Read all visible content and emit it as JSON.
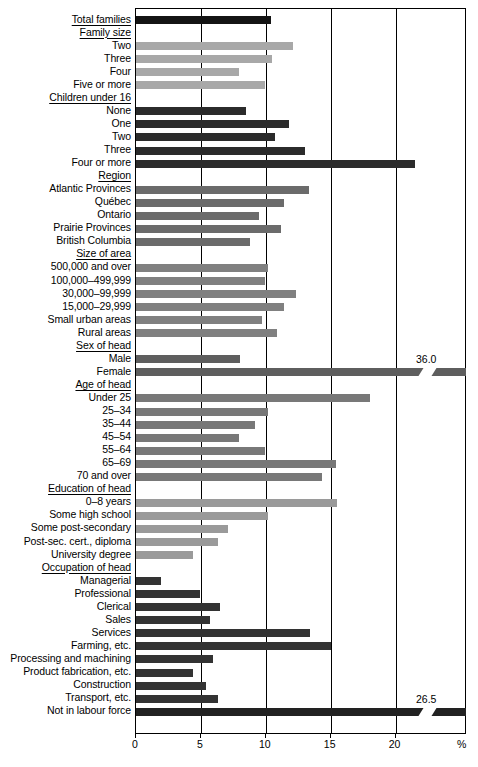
{
  "chart_data": {
    "type": "bar",
    "orientation": "horizontal",
    "title": "",
    "xlabel": "%",
    "ylabel": "",
    "xlim": [
      0,
      25.5
    ],
    "xticks": [
      0,
      5,
      10,
      15,
      20
    ],
    "xtick_labels": [
      "0",
      "5",
      "10",
      "15",
      "20"
    ],
    "grid": true,
    "grid_axis": "x",
    "legend": "none",
    "axis_unit": "%",
    "note": "Bars exceeding the axis maximum are drawn broken with their value printed at the right.",
    "rows": [
      {
        "label": "Total families",
        "kind": "heading-bar",
        "value": 10.4,
        "color": "#141414",
        "underline": true
      },
      {
        "label": "Family size",
        "kind": "section",
        "value": null,
        "color": null,
        "underline": true
      },
      {
        "label": "Two",
        "kind": "bar",
        "value": 12.1,
        "color": "#a8a8a8",
        "underline": false
      },
      {
        "label": "Three",
        "kind": "bar",
        "value": 10.5,
        "color": "#a8a8a8",
        "underline": false
      },
      {
        "label": "Four",
        "kind": "bar",
        "value": 7.9,
        "color": "#a8a8a8",
        "underline": false
      },
      {
        "label": "Five or more",
        "kind": "bar",
        "value": 9.9,
        "color": "#a8a8a8",
        "underline": false
      },
      {
        "label": "Children under 16",
        "kind": "section",
        "value": null,
        "color": null,
        "underline": true
      },
      {
        "label": "None",
        "kind": "bar",
        "value": 8.5,
        "color": "#2b2b2b",
        "underline": false
      },
      {
        "label": "One",
        "kind": "bar",
        "value": 11.8,
        "color": "#2b2b2b",
        "underline": false
      },
      {
        "label": "Two",
        "kind": "bar",
        "value": 10.7,
        "color": "#2b2b2b",
        "underline": false
      },
      {
        "label": "Three",
        "kind": "bar",
        "value": 13.0,
        "color": "#2b2b2b",
        "underline": false
      },
      {
        "label": "Four or more",
        "kind": "bar",
        "value": 21.5,
        "color": "#2b2b2b",
        "underline": false
      },
      {
        "label": "Region",
        "kind": "section",
        "value": null,
        "color": null,
        "underline": true
      },
      {
        "label": "Atlantic Provinces",
        "kind": "bar",
        "value": 13.3,
        "color": "#6b6b6b",
        "underline": false
      },
      {
        "label": "Québec",
        "kind": "bar",
        "value": 11.4,
        "color": "#6b6b6b",
        "underline": false
      },
      {
        "label": "Ontario",
        "kind": "bar",
        "value": 9.5,
        "color": "#6b6b6b",
        "underline": false
      },
      {
        "label": "Prairie Provinces",
        "kind": "bar",
        "value": 11.2,
        "color": "#6b6b6b",
        "underline": false
      },
      {
        "label": "British Columbia",
        "kind": "bar",
        "value": 8.8,
        "color": "#6b6b6b",
        "underline": false
      },
      {
        "label": "Size of area",
        "kind": "section",
        "value": null,
        "color": null,
        "underline": true
      },
      {
        "label": "500,000 and over",
        "kind": "bar",
        "value": 10.2,
        "color": "#808080",
        "underline": false
      },
      {
        "label": "100,000–499,999",
        "kind": "bar",
        "value": 9.9,
        "color": "#808080",
        "underline": false
      },
      {
        "label": "30,000–99,999",
        "kind": "bar",
        "value": 12.3,
        "color": "#808080",
        "underline": false
      },
      {
        "label": "15,000–29,999",
        "kind": "bar",
        "value": 11.4,
        "color": "#808080",
        "underline": false
      },
      {
        "label": "Small urban areas",
        "kind": "bar",
        "value": 9.7,
        "color": "#808080",
        "underline": false
      },
      {
        "label": "Rural areas",
        "kind": "bar",
        "value": 10.9,
        "color": "#808080",
        "underline": false
      },
      {
        "label": "Sex of head",
        "kind": "section",
        "value": null,
        "color": null,
        "underline": true
      },
      {
        "label": "Male",
        "kind": "bar",
        "value": 8.0,
        "color": "#5e5e5e",
        "underline": false
      },
      {
        "label": "Female",
        "kind": "bar-broken",
        "value": 36.0,
        "value_label": "36.0",
        "color": "#5e5e5e",
        "underline": false
      },
      {
        "label": "Age of head",
        "kind": "section",
        "value": null,
        "color": null,
        "underline": true
      },
      {
        "label": "Under 25",
        "kind": "bar",
        "value": 18.0,
        "color": "#787878",
        "underline": false
      },
      {
        "label": "25–34",
        "kind": "bar",
        "value": 10.2,
        "color": "#787878",
        "underline": false
      },
      {
        "label": "35–44",
        "kind": "bar",
        "value": 9.2,
        "color": "#787878",
        "underline": false
      },
      {
        "label": "45–54",
        "kind": "bar",
        "value": 7.9,
        "color": "#787878",
        "underline": false
      },
      {
        "label": "55–64",
        "kind": "bar",
        "value": 9.9,
        "color": "#787878",
        "underline": false
      },
      {
        "label": "65–69",
        "kind": "bar",
        "value": 15.4,
        "color": "#787878",
        "underline": false
      },
      {
        "label": "70 and over",
        "kind": "bar",
        "value": 14.3,
        "color": "#787878",
        "underline": false
      },
      {
        "label": "Education of head",
        "kind": "section",
        "value": null,
        "color": null,
        "underline": true
      },
      {
        "label": "0–8 years",
        "kind": "bar",
        "value": 15.5,
        "color": "#9a9a9a",
        "underline": false
      },
      {
        "label": "Some high school",
        "kind": "bar",
        "value": 10.2,
        "color": "#9a9a9a",
        "underline": false
      },
      {
        "label": "Some post-secondary",
        "kind": "bar",
        "value": 7.1,
        "color": "#9a9a9a",
        "underline": false
      },
      {
        "label": "Post-sec. cert., diploma",
        "kind": "bar",
        "value": 6.3,
        "color": "#9a9a9a",
        "underline": false
      },
      {
        "label": "University degree",
        "kind": "bar",
        "value": 4.4,
        "color": "#9a9a9a",
        "underline": false
      },
      {
        "label": "Occupation of head",
        "kind": "section",
        "value": null,
        "color": null,
        "underline": true
      },
      {
        "label": "Managerial",
        "kind": "bar",
        "value": 1.9,
        "color": "#333333",
        "underline": false
      },
      {
        "label": "Professional",
        "kind": "bar",
        "value": 4.9,
        "color": "#333333",
        "underline": false
      },
      {
        "label": "Clerical",
        "kind": "bar",
        "value": 6.5,
        "color": "#333333",
        "underline": false
      },
      {
        "label": "Sales",
        "kind": "bar",
        "value": 5.7,
        "color": "#333333",
        "underline": false
      },
      {
        "label": "Services",
        "kind": "bar",
        "value": 13.4,
        "color": "#333333",
        "underline": false
      },
      {
        "label": "Farming, etc.",
        "kind": "bar",
        "value": 15.0,
        "color": "#333333",
        "underline": false
      },
      {
        "label": "Processing and machining",
        "kind": "bar",
        "value": 5.9,
        "color": "#333333",
        "underline": false
      },
      {
        "label": "Product fabrication, etc.",
        "kind": "bar",
        "value": 4.4,
        "color": "#333333",
        "underline": false
      },
      {
        "label": "Construction",
        "kind": "bar",
        "value": 5.4,
        "color": "#333333",
        "underline": false
      },
      {
        "label": "Transport, etc.",
        "kind": "bar",
        "value": 6.3,
        "color": "#333333",
        "underline": false
      },
      {
        "label": "Not in labour force",
        "kind": "bar-broken",
        "value": 26.5,
        "value_label": "26.5",
        "color": "#222222",
        "underline": false
      }
    ]
  }
}
